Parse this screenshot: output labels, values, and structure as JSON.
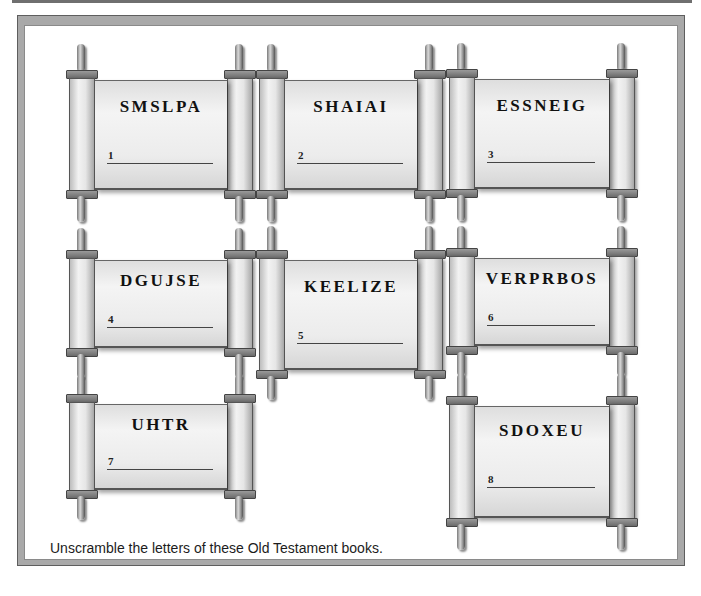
{
  "instructions": "Unscramble the letters of these Old Testament books.",
  "scrolls": [
    {
      "number": "1",
      "scrambled": "SMSLPA"
    },
    {
      "number": "2",
      "scrambled": "SHAIAI"
    },
    {
      "number": "3",
      "scrambled": "ESSNEIG"
    },
    {
      "number": "4",
      "scrambled": "DGUJSE"
    },
    {
      "number": "5",
      "scrambled": "KEELIZE"
    },
    {
      "number": "6",
      "scrambled": "VERPRBOS"
    },
    {
      "number": "7",
      "scrambled": "UHTR"
    },
    {
      "number": "8",
      "scrambled": "SDOXEU"
    }
  ],
  "colors": {
    "frame": "#a9a9a9",
    "paper": "#ececec",
    "text": "#111111"
  }
}
